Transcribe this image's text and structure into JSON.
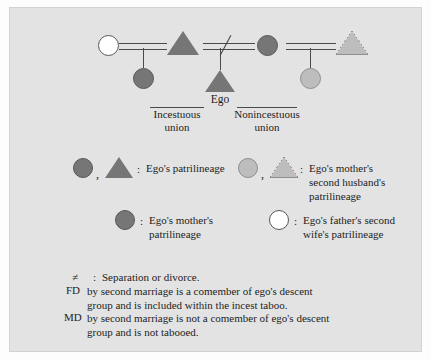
{
  "figure": {
    "type": "kinship-diagram",
    "background_color": "#e3e3e3",
    "page_color": "#fdfdfd"
  },
  "palette": {
    "dark_gray": "#767676",
    "mid_gray": "#7d7d7d",
    "light_gray": "#bdbdbd",
    "white": "#ffffff",
    "line": "#4a4a4a",
    "text": "#1d1d1d"
  },
  "diagram": {
    "persons": [
      {
        "id": "fathers-second-wife",
        "shape": "circle",
        "fill": "white",
        "role": "father's second wife"
      },
      {
        "id": "father",
        "shape": "triangle",
        "fill": "dark_gray",
        "role": "father"
      },
      {
        "id": "mother",
        "shape": "circle",
        "fill": "dark_gray",
        "role": "mother"
      },
      {
        "id": "mothers-second-husband",
        "shape": "triangle",
        "fill": "light_gray",
        "role": "mother's second husband"
      },
      {
        "id": "father-daughter",
        "shape": "circle",
        "fill": "dark_gray",
        "role": "FD by second marriage"
      },
      {
        "id": "ego",
        "shape": "triangle",
        "fill": "dark_gray",
        "role": "ego"
      },
      {
        "id": "mother-daughter",
        "shape": "circle",
        "fill": "light_gray",
        "role": "MD by second marriage"
      }
    ],
    "ego_label": "Ego",
    "union_left": {
      "line1": "Incestuous",
      "line2": "union"
    },
    "union_right": {
      "line1": "Nonincestuous",
      "line2": "union"
    },
    "divorce_symbol": "≠"
  },
  "legend": {
    "items": [
      {
        "id": "egos-patrilineage",
        "symbols": [
          "circle-dark",
          "triangle-dark"
        ],
        "separator": ",",
        "colon": ":",
        "text": "Ego's patrilineage"
      },
      {
        "id": "mothers-second-husbands-patrilineage",
        "symbols": [
          "circle-light",
          "triangle-light"
        ],
        "separator": ",",
        "colon": ":",
        "text": "Ego's mother's second husband's patrilineage"
      },
      {
        "id": "egos-mothers-patrilineage",
        "symbols": [
          "circle-dark"
        ],
        "colon": ":",
        "text": "Ego's mother's patrilineage"
      },
      {
        "id": "egos-fathers-second-wifes-patrilineage",
        "symbols": [
          "circle-white"
        ],
        "colon": ":",
        "text": "Ego's father's second wife's patrilineage"
      }
    ]
  },
  "notes": [
    {
      "tag": "≠",
      "colon": ":",
      "text": "Separation or divorce."
    },
    {
      "tag": "FD",
      "text": "by second marriage is a comember of ego's descent group and is included within the incest taboo."
    },
    {
      "tag": "MD",
      "text": "by second marriage is not a comember of ego's descent group and is not tabooed."
    }
  ]
}
